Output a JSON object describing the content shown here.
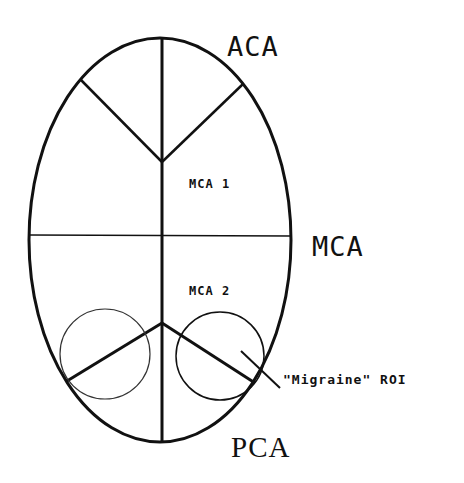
{
  "diagram": {
    "labels": {
      "aca": "ACA",
      "mca": "MCA",
      "pca": "PCA",
      "mca1": "MCA 1",
      "mca2": "MCA 2",
      "roi": "\"Migraine\" ROI"
    },
    "colors": {
      "stroke": "#111111",
      "background": "#ffffff"
    }
  }
}
